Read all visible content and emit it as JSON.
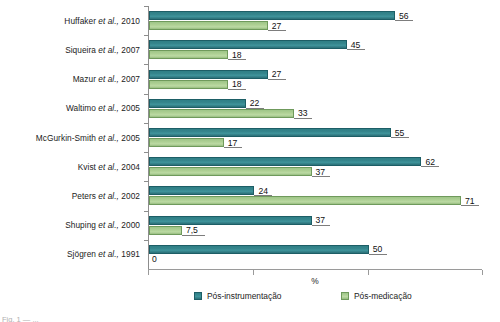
{
  "chart_data": {
    "type": "bar",
    "orientation": "horizontal",
    "title": "",
    "xlabel": "%",
    "ylabel": "",
    "xlim": [
      0,
      76
    ],
    "grid": false,
    "legend_position": "bottom",
    "categories": [
      "Huffaker et al., 2010",
      "Siqueira et al., 2007",
      "Mazur et al., 2007",
      "Waltimo et al., 2005",
      "McGurkin-Smith et al., 2005",
      "Kvist et al., 2004",
      "Peters et al., 2002",
      "Shuping et al., 2000",
      "Sjögren et al., 1991"
    ],
    "category_parts": [
      {
        "author": "Huffaker ",
        "ital": "et al.,",
        "year": " 2010"
      },
      {
        "author": "Siqueira ",
        "ital": "et al.,",
        "year": " 2007"
      },
      {
        "author": "Mazur ",
        "ital": "et al.,",
        "year": " 2007"
      },
      {
        "author": "Waltimo ",
        "ital": "et al.,",
        "year": " 2005"
      },
      {
        "author": "McGurkin-Smith ",
        "ital": "et al.,",
        "year": " 2005"
      },
      {
        "author": "Kvist ",
        "ital": "et al.,",
        "year": " 2004"
      },
      {
        "author": "Peters ",
        "ital": "et al.,",
        "year": " 2002"
      },
      {
        "author": "Shuping ",
        "ital": "et al.,",
        "year": " 2000"
      },
      {
        "author": "Sjögren ",
        "ital": "et al.,",
        "year": " 1991"
      }
    ],
    "series": [
      {
        "name": "Pós-instrumentação",
        "color": "#35858c",
        "values": [
          56,
          45,
          27,
          22,
          55,
          62,
          24,
          37,
          50
        ],
        "labels": [
          "56",
          "45",
          "27",
          "22",
          "55",
          "62",
          "24",
          "37",
          "50"
        ]
      },
      {
        "name": "Pós-medicação",
        "color": "#aed094",
        "values": [
          27,
          18,
          18,
          33,
          17,
          37,
          71,
          7.5,
          0
        ],
        "labels": [
          "27",
          "18",
          "18",
          "33",
          "17",
          "37",
          "71",
          "7,5",
          "0"
        ]
      }
    ],
    "xticks": [
      0,
      24,
      50,
      76
    ],
    "colors": {
      "series_1": "#35858c",
      "series_1_border": "#1d5e66",
      "series_2": "#aed094",
      "series_2_border": "#6f9a5c",
      "axis": "#8d8d8d",
      "text": "#1b1b1b",
      "background": "#ffffff"
    }
  },
  "legend": {
    "items": [
      {
        "label": "Pós-instrumentação",
        "swatch": "teal"
      },
      {
        "label": "Pós-medicação",
        "swatch": "green"
      }
    ]
  },
  "axis": {
    "x_title": "%"
  },
  "caption": {
    "sliver_text": "Fig. 1 — ..."
  }
}
